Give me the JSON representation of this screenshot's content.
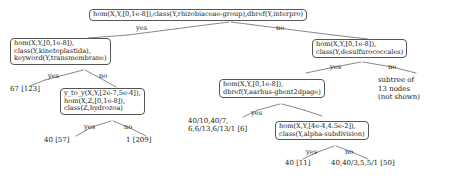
{
  "diagram": {
    "type": "decision-tree",
    "root": {
      "label": "hom(X,Y,[0,1e-8]),class(Y,rhizobiaceae-group),dbref(Y,interpro)"
    },
    "nodes": {
      "left_child": {
        "line1": "hom(X,Y,[0,1e-8]),",
        "line2": "class(Y,kinetoplastida),",
        "line3": "keyword(Y,transmembrane)"
      },
      "right_child": {
        "line1": "hom(X,Y,[0,1e-8]),",
        "line2": "class(Y,desulfurococcales)"
      },
      "hydrozoa": {
        "line1": "y_to_y(X,Y,[2e-7,5e-4]),",
        "line2": "hom(X,Z,[0,1e-8]),",
        "line3": "class(Z,hydrozoa)"
      },
      "dpage": {
        "line1": "hom(X,Y,[0,1e-8]),",
        "line2": "dbref(Y,aarhus-ghent2dpage)"
      },
      "alpha": {
        "line1": "hom(X,Y,[4e-4,4.5e-2]),",
        "line2": "class(Y,alpha-subdivision)"
      }
    },
    "leaves": {
      "kineto_yes": "67 [123]",
      "hydrozoa_yes": "40 [57]",
      "hydrozoa_no": "1 [209]",
      "dpage_stats_line1": "40/10,40/7,",
      "dpage_stats_line2": "6,6/13,6/13/1 [6]",
      "alpha_yes": "40 [11]",
      "alpha_no": "40,40/3,5,5/1 [50]"
    },
    "notes": {
      "subtree_line1": "subtree of",
      "subtree_line2": "13 nodes",
      "subtree_line3": "(not shown)"
    },
    "edge_labels": {
      "root_yes": "yes",
      "root_no": "no",
      "kineto_yes": "yes",
      "kineto_no": "no",
      "hydrozoa_yes": "yes",
      "hydrozoa_no": "no",
      "desulf_yes": "yes",
      "desulf_no": "no",
      "dpage_yes": "yes",
      "alpha_yes": "yes",
      "alpha_no": "no"
    },
    "colors": {
      "node_border": "#555555",
      "edge_line": "#555555",
      "text": "#1a1a1a",
      "background": "#ffffff"
    }
  }
}
